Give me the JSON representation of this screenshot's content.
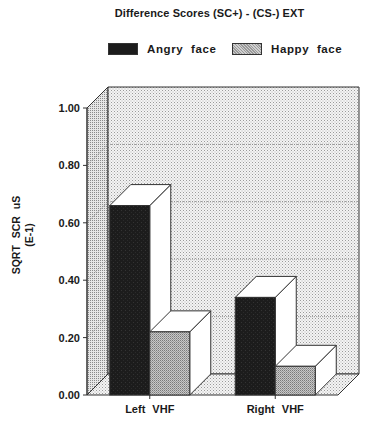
{
  "chart_data": {
    "type": "bar",
    "style": "3d-clustered",
    "title": "Difference Scores (SC+) - (CS-) EXT",
    "xlabel": "",
    "ylabel": "SQRT SCR uS",
    "ylabel_line2": "(E-1)",
    "categories": [
      "Left VHF",
      "Right VHF"
    ],
    "series": [
      {
        "name": "Angry face",
        "values": [
          0.66,
          0.34
        ],
        "color": "#1c1c1c",
        "pattern": "solid-dark"
      },
      {
        "name": "Happy face",
        "values": [
          0.22,
          0.1
        ],
        "color": "#b8b8b8",
        "pattern": "fine-hatch-gray"
      }
    ],
    "ylim": [
      0,
      1.0
    ],
    "yticks": [
      0.0,
      0.2,
      0.4,
      0.6,
      0.8,
      1.0
    ],
    "ytick_labels": [
      "0.00",
      "0.20",
      "0.40",
      "0.60",
      "0.80",
      "1.00"
    ],
    "grid": true,
    "legend_position": "top"
  }
}
